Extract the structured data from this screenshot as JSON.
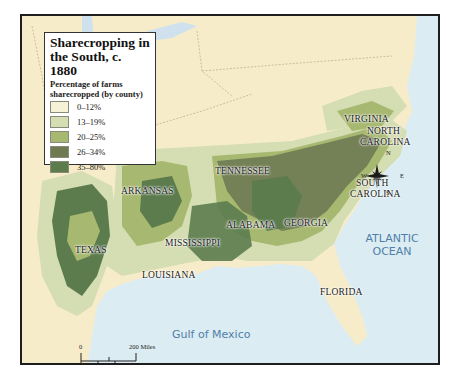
{
  "legend": {
    "title_line1": "Sharecropping in",
    "title_line2": "the South, c. 1880",
    "subtitle_line1": "Percentage of farms",
    "subtitle_line2": "sharecropped  (by county)",
    "items": [
      {
        "label": "0–12%",
        "color": "#f6f2d8"
      },
      {
        "label": "13–19%",
        "color": "#d5ddb2"
      },
      {
        "label": "20–25%",
        "color": "#a7b870"
      },
      {
        "label": "26–34%",
        "color": "#6f7a52"
      },
      {
        "label": "35–80%",
        "color": "#5c7c4e"
      }
    ]
  },
  "states": {
    "virginia": "VIRGINIA",
    "north_carolina_1": "NORTH",
    "north_carolina_2": "CAROLINA",
    "tennessee": "TENNESSEE",
    "south_carolina_1": "SOUTH",
    "south_carolina_2": "CAROLINA",
    "arkansas": "ARKANSAS",
    "alabama": "ALABAMA",
    "georgia": "GEORGIA",
    "mississippi": "MISSISSIPPI",
    "texas": "TEXAS",
    "louisiana": "LOUISIANA",
    "florida": "FLORIDA"
  },
  "water": {
    "atlantic_1": "ATLANTIC",
    "atlantic_2": "OCEAN",
    "gulf": "Gulf of Mexico"
  },
  "compass": {
    "n": "N",
    "s": "S",
    "e": "E",
    "w": "W"
  },
  "scale": {
    "zero_top": "0",
    "miles": "200 Miles",
    "zero_bottom": "0",
    "km": "200 Kilometers"
  },
  "colors": {
    "land": "#f7ecc9",
    "water": "#dcecf3",
    "border": "#1e1e1e"
  }
}
